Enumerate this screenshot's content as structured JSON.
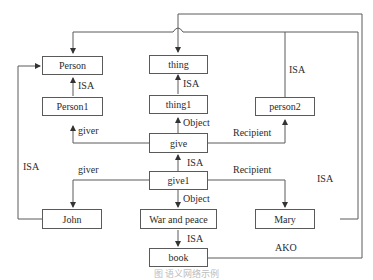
{
  "diagram": {
    "type": "semantic-network",
    "nodes": [
      {
        "id": "Person",
        "label": "Person"
      },
      {
        "id": "Person1",
        "label": "Person1"
      },
      {
        "id": "thing",
        "label": "thing"
      },
      {
        "id": "thing1",
        "label": "thing1"
      },
      {
        "id": "person2",
        "label": "person2"
      },
      {
        "id": "give",
        "label": "give"
      },
      {
        "id": "give1",
        "label": "give1"
      },
      {
        "id": "John",
        "label": "John"
      },
      {
        "id": "WarAndPeace",
        "label": "War and peace"
      },
      {
        "id": "Mary",
        "label": "Mary"
      },
      {
        "id": "book",
        "label": "book"
      }
    ],
    "edges": [
      {
        "from": "Person1",
        "to": "Person",
        "label": "ISA"
      },
      {
        "from": "thing1",
        "to": "thing",
        "label": "ISA"
      },
      {
        "from": "give",
        "to": "Person1",
        "label": "giver"
      },
      {
        "from": "give",
        "to": "thing1",
        "label": "Object"
      },
      {
        "from": "give",
        "to": "person2",
        "label": "Recipient"
      },
      {
        "from": "person2",
        "to": "Person",
        "label": "ISA"
      },
      {
        "from": "give1",
        "to": "give",
        "label": "ISA"
      },
      {
        "from": "give1",
        "to": "John",
        "label": "giver"
      },
      {
        "from": "give1",
        "to": "WarAndPeace",
        "label": "Object"
      },
      {
        "from": "give1",
        "to": "Mary",
        "label": "Recipient"
      },
      {
        "from": "John",
        "to": "Person",
        "label": "ISA"
      },
      {
        "from": "Mary",
        "to": "Person",
        "label": "ISA"
      },
      {
        "from": "WarAndPeace",
        "to": "book",
        "label": "ISA"
      },
      {
        "from": "book",
        "to": "thing",
        "label": "AKO"
      }
    ],
    "edge_labels": {
      "person1_person_isa": "ISA",
      "thing1_thing_isa": "ISA",
      "give_person1_giver": "giver",
      "give_thing1_object": "Object",
      "give_person2_recipient": "Recipient",
      "person2_person_isa": "ISA",
      "give1_give_isa": "ISA",
      "give1_john_giver": "giver",
      "give1_war_object": "Object",
      "give1_mary_recipient": "Recipient",
      "john_person_isa": "ISA",
      "mary_person_isa": "ISA",
      "war_book_isa": "ISA",
      "book_thing_ako": "AKO"
    },
    "line_color": "#5a5a5a"
  },
  "caption": "图 语义网络示例"
}
